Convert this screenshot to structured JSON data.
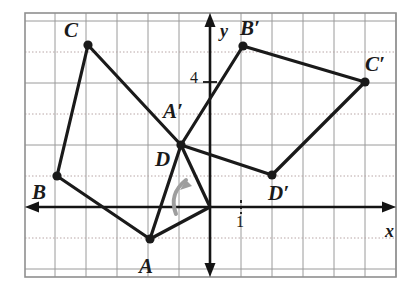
{
  "figure": {
    "kind": "coordinate-grid-rotation-diagram",
    "grid": {
      "unit_px": 31,
      "origin_px": {
        "x": 210,
        "y": 207
      },
      "bounds_px": {
        "left": 25,
        "top": 13,
        "right": 396,
        "bottom": 277
      },
      "x_range": [
        -6,
        6
      ],
      "y_range": [
        -2,
        6
      ],
      "grid_color": "#9a9a9a",
      "dotted_color": "#b8a6a6",
      "border_color": "#8f8f8f",
      "show_grid": true
    },
    "axes": {
      "color": "#141414",
      "x_label": "x",
      "y_label": "y",
      "x_label_pos": {
        "x": 385,
        "y": 222
      },
      "y_label_pos": {
        "x": 220,
        "y": 22
      }
    },
    "ticks": [
      {
        "name": "y-tick-4",
        "text": "4",
        "value": 4,
        "axis": "y",
        "pos": {
          "x": 190,
          "y": 70
        }
      },
      {
        "name": "x-tick-1",
        "text": "1",
        "value": 1,
        "axis": "x",
        "pos": {
          "x": 236,
          "y": 214
        }
      }
    ],
    "stroke": {
      "figure_color": "#1a1a1a",
      "figure_width": 3.2,
      "vertex_radius": 4.6,
      "axis_width": 2.6,
      "grid_width": 1
    },
    "rotation_arrow": {
      "name": "rotation-arrow",
      "color": "#9e9e9e",
      "path": "M 176 214 C 170 198 176 188 186 180",
      "head": "M 186 180 L 180 190 L 192 186 Z",
      "width": 4
    },
    "vertices": {
      "preimage": [
        {
          "id": "A",
          "label": "A",
          "x": -2,
          "y": -1,
          "px": {
            "x": 150,
            "y": 239
          },
          "label_px": {
            "x": 139,
            "y": 256
          }
        },
        {
          "id": "B",
          "label": "B",
          "x": -5,
          "y": 1,
          "px": {
            "x": 57,
            "y": 176
          },
          "label_px": {
            "x": 32,
            "y": 182
          }
        },
        {
          "id": "C",
          "label": "C",
          "x": -4,
          "y": 5,
          "px": {
            "x": 88,
            "y": 45
          },
          "label_px": {
            "x": 64,
            "y": 20
          }
        },
        {
          "id": "D",
          "label": "D",
          "x": -1,
          "y": 2,
          "px": {
            "x": 181,
            "y": 145
          },
          "label_px": {
            "x": 155,
            "y": 149
          }
        }
      ],
      "image": [
        {
          "id": "A'",
          "label": "A′",
          "x": -1,
          "y": 2,
          "px": {
            "x": 181,
            "y": 145
          },
          "label_px": {
            "x": 163,
            "y": 101
          }
        },
        {
          "id": "B'",
          "label": "B′",
          "x": 1,
          "y": 5,
          "px": {
            "x": 243,
            "y": 46
          },
          "label_px": {
            "x": 240,
            "y": 18
          }
        },
        {
          "id": "C'",
          "label": "C′",
          "x": 5,
          "y": 4,
          "px": {
            "x": 365,
            "y": 82
          },
          "label_px": {
            "x": 365,
            "y": 54
          }
        },
        {
          "id": "D'",
          "label": "D′",
          "x": 2,
          "y": 1,
          "px": {
            "x": 272,
            "y": 175
          },
          "label_px": {
            "x": 268,
            "y": 183
          }
        }
      ]
    },
    "polygons": [
      {
        "name": "preimage-quadrilateral-abcd",
        "points": "150,239 57,176 88,45 181,145"
      },
      {
        "name": "image-quadrilateral-a-b-c-d-prime",
        "points": "181,145 243,46 365,82 272,175"
      }
    ],
    "connector_segments": [
      {
        "name": "segment-a-to-origin",
        "from": {
          "x": 150,
          "y": 239
        },
        "to": {
          "x": 210,
          "y": 207
        }
      },
      {
        "name": "segment-d-to-origin",
        "from": {
          "x": 181,
          "y": 145
        },
        "to": {
          "x": 210,
          "y": 207
        }
      }
    ]
  }
}
